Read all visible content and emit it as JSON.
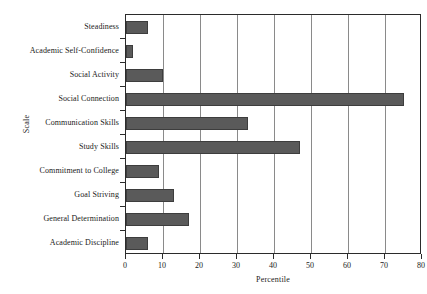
{
  "chart_data": {
    "type": "bar",
    "orientation": "horizontal",
    "title": "",
    "xlabel": "Percentile",
    "ylabel": "Scale",
    "xlim": [
      0,
      80
    ],
    "xticks": [
      0,
      10,
      20,
      30,
      40,
      50,
      60,
      70,
      80
    ],
    "grid": true,
    "legend": false,
    "bar_color": "#5a5a5a",
    "categories": [
      "Steadiness",
      "Academic Self-Confidence",
      "Social Activity",
      "Social Connection",
      "Communication Skills",
      "Study Skills",
      "Commitment to College",
      "Goal Striving",
      "General Determination",
      "Academic Discipline"
    ],
    "values": [
      6,
      2,
      10,
      75,
      33,
      47,
      9,
      13,
      17,
      6
    ]
  }
}
